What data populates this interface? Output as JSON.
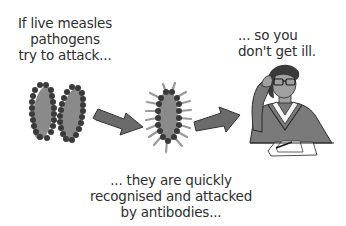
{
  "diagram": {
    "colors": {
      "background": "#ffffff",
      "text": "#2e2e2e",
      "pathogen_body": "#8a8a8a",
      "pathogen_dots": "#3a3a3a",
      "antibody_spikes": "#9a9a9a",
      "arrow_fill": "#6b6b6b",
      "arrow_stroke": "#333333",
      "person_sweater": "#7a7a7a",
      "person_skin": "#a0a0a0",
      "person_hair": "#3a3a3a"
    },
    "steps": [
      {
        "id": "step-1",
        "figure": "two-measles-pathogens",
        "caption_lines": [
          "If live measles",
          "pathogens",
          "try to attack..."
        ]
      },
      {
        "id": "step-2",
        "figure": "pathogen-with-antibodies",
        "caption_lines": [
          "... they are quickly",
          "recognised and attacked",
          "by antibodies..."
        ]
      },
      {
        "id": "step-3",
        "figure": "healthy-person-at-desk",
        "caption_lines": [
          "... so you",
          "don't get ill."
        ]
      }
    ],
    "connectors": [
      {
        "from": "step-1",
        "to": "step-2",
        "icon": "arrow-right-icon"
      },
      {
        "from": "step-2",
        "to": "step-3",
        "icon": "arrow-right-icon"
      }
    ]
  }
}
